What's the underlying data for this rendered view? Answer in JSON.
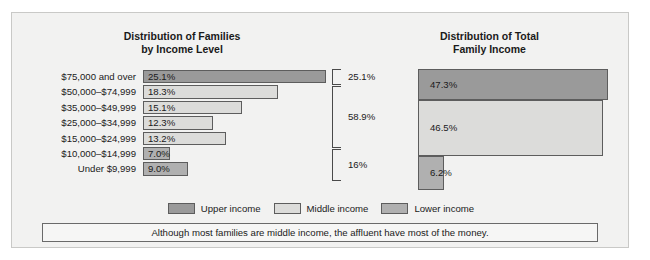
{
  "figure": {
    "caption": "Although most families are middle income, the affluent have most of the money."
  },
  "legend": {
    "items": [
      {
        "label": "Upper income",
        "color": "#9a9a9a"
      },
      {
        "label": "Middle income",
        "color": "#dcdcda"
      },
      {
        "label": "Lower income",
        "color": "#b0b0b0"
      }
    ]
  },
  "chart_data": [
    {
      "type": "bar",
      "orientation": "horizontal",
      "title": "Distribution of Families by Income Level",
      "title_line1": "Distribution of Families",
      "title_line2": "by Income Level",
      "xlabel": "",
      "ylabel": "",
      "grid": false,
      "legend_position": "bottom-center",
      "categories": [
        "$75,000 and over",
        "$50,000–$74,999",
        "$35,000–$49,999",
        "$25,000–$34,999",
        "$15,000–$24,999",
        "$10,000–$14,999",
        "Under $9,999"
      ],
      "values": [
        25.1,
        18.3,
        15.1,
        12.3,
        13.2,
        7.0,
        9.0
      ],
      "value_labels": [
        "25.1%",
        "18.3%",
        "15.1%",
        "12.3%",
        "13.2%",
        "7.0%",
        "9.0%"
      ],
      "bar_lengths_px": [
        183,
        135,
        99,
        70,
        83,
        27,
        45
      ],
      "series_class": [
        "upper",
        "middle",
        "middle",
        "middle",
        "middle",
        "lower",
        "lower"
      ],
      "brackets": [
        {
          "label": "25.1%",
          "covers": [
            "$75,000 and over"
          ],
          "top_px": 0,
          "height_px": 16
        },
        {
          "label": "58.9%",
          "covers": [
            "$50,000–$74,999",
            "$35,000–$49,999",
            "$25,000–$34,999",
            "$15,000–$24,999"
          ],
          "top_px": 17,
          "height_px": 62
        },
        {
          "label": "16%",
          "covers": [
            "$10,000–$14,999",
            "Under $9,999"
          ],
          "top_px": 80,
          "height_px": 32
        }
      ]
    },
    {
      "type": "bar",
      "orientation": "horizontal",
      "title": "Distribution of Total Family Income",
      "title_line1": "Distribution of Total",
      "title_line2": "Family Income",
      "xlabel": "",
      "ylabel": "",
      "grid": false,
      "legend_position": "bottom-center",
      "categories": [
        "Upper income",
        "Middle income",
        "Lower income"
      ],
      "values": [
        47.3,
        46.5,
        6.2
      ],
      "value_labels": [
        "47.3%",
        "46.5%",
        "6.2%"
      ],
      "bar_lengths_px": [
        190,
        185,
        26
      ],
      "bar_heights_px": [
        31,
        56,
        34
      ],
      "series_class": [
        "upper",
        "middle",
        "lower"
      ]
    }
  ]
}
